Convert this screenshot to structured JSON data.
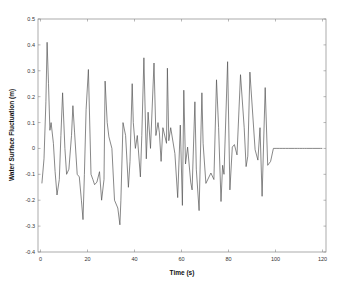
{
  "chart_data": {
    "type": "line",
    "title": "",
    "xlabel": "Time (s)",
    "ylabel": "Water Surface Fluctuation (m)",
    "xlim": [
      -2,
      122
    ],
    "ylim": [
      -0.4,
      0.5
    ],
    "xticks": [
      0,
      20,
      40,
      60,
      80,
      100,
      120
    ],
    "yticks": [
      -0.4,
      -0.3,
      -0.2,
      -0.1,
      0,
      0.1,
      0.2,
      0.3,
      0.4,
      0.5
    ],
    "xtick_labels": [
      "0",
      "20",
      "40",
      "60",
      "80",
      "100",
      "120"
    ],
    "ytick_labels": [
      "-0.4",
      "-0.3",
      "-0.2",
      "-0.1",
      "0",
      "0.1",
      "0.2",
      "0.3",
      "0.4",
      "0.5"
    ],
    "grid": false,
    "legend": null,
    "series": [
      {
        "name": "Water surface fluctuation",
        "color": "#555555",
        "x": [
          0.6,
          1.5,
          2.3,
          2.8,
          3.4,
          4.0,
          4.5,
          5.5,
          6.2,
          7.0,
          8.0,
          8.7,
          9.4,
          10.4,
          11.1,
          12.1,
          13.2,
          13.8,
          14.5,
          15.6,
          16.5,
          17.4,
          18.1,
          18.7,
          19.4,
          20.4,
          21.5,
          22.3,
          23.0,
          24.0,
          25.1,
          26.0,
          27.0,
          27.5,
          28.4,
          29.1,
          30.4,
          31.5,
          32.9,
          33.8,
          34.2,
          35.1,
          36.2,
          37.4,
          38.1,
          39.0,
          39.5,
          40.4,
          41.2,
          42.5,
          43.1,
          44.0,
          45.0,
          45.8,
          46.8,
          48.3,
          49.1,
          50.0,
          50.6,
          51.3,
          52.1,
          53.6,
          54.0,
          54.6,
          55.4,
          57.2,
          58.4,
          59.5,
          60.4,
          61.0,
          61.7,
          62.6,
          63.9,
          64.5,
          65.7,
          66.3,
          67.5,
          68.7,
          69.2,
          70.4,
          72.5,
          73.8,
          74.9,
          75.8,
          76.8,
          77.5,
          78.1,
          79.6,
          80.6,
          81.6,
          82.5,
          83.6,
          85.1,
          86.7,
          87.5,
          88.2,
          89.1,
          91.3,
          92.5,
          93.4,
          94.3,
          95.6,
          96.7,
          97.9,
          99.1,
          100.6,
          101.8,
          103.1,
          104.3,
          105.6,
          107.0,
          108.0,
          109.3,
          110.2,
          111.4,
          112.3,
          113.1,
          115.6,
          116.8,
          118.1,
          119.2,
          119.9
        ],
        "y": [
          -0.135,
          -0.04,
          0.18,
          0.41,
          0.25,
          0.07,
          0.1,
          0.02,
          -0.09,
          -0.18,
          -0.12,
          0.05,
          0.215,
          0.0,
          -0.1,
          -0.08,
          0.05,
          0.165,
          0.06,
          -0.1,
          -0.11,
          -0.2,
          -0.275,
          -0.1,
          0.15,
          0.305,
          -0.1,
          -0.12,
          -0.14,
          -0.13,
          -0.09,
          -0.2,
          -0.12,
          0.26,
          0.1,
          0.045,
          0.0,
          -0.2,
          -0.23,
          -0.295,
          -0.2,
          0.1,
          0.05,
          -0.15,
          -0.05,
          0.25,
          0.1,
          0.0,
          0.05,
          -0.11,
          0.05,
          0.35,
          -0.04,
          0.14,
          0.0,
          0.33,
          0.05,
          0.1,
          0.06,
          -0.05,
          0.08,
          0.02,
          0.31,
          0.03,
          0.08,
          -0.02,
          -0.19,
          0.09,
          -0.22,
          0.225,
          -0.06,
          0.005,
          -0.13,
          -0.16,
          0.18,
          -0.08,
          -0.24,
          0.215,
          0.02,
          -0.135,
          -0.095,
          -0.12,
          0.265,
          0.08,
          -0.205,
          -0.065,
          -0.1,
          0.335,
          -0.16,
          0.005,
          0.015,
          -0.025,
          0.285,
          0.08,
          -0.07,
          -0.03,
          0.295,
          -0.005,
          -0.045,
          0.08,
          -0.185,
          0.235,
          -0.065,
          -0.05,
          0.0,
          0.0,
          0.0,
          0.0,
          0.0,
          0.0,
          0.0,
          0.0,
          0.0,
          0.0,
          0.0,
          0.0,
          0.0,
          0.0,
          0.0,
          0.0,
          0.0,
          0.0
        ]
      }
    ]
  }
}
